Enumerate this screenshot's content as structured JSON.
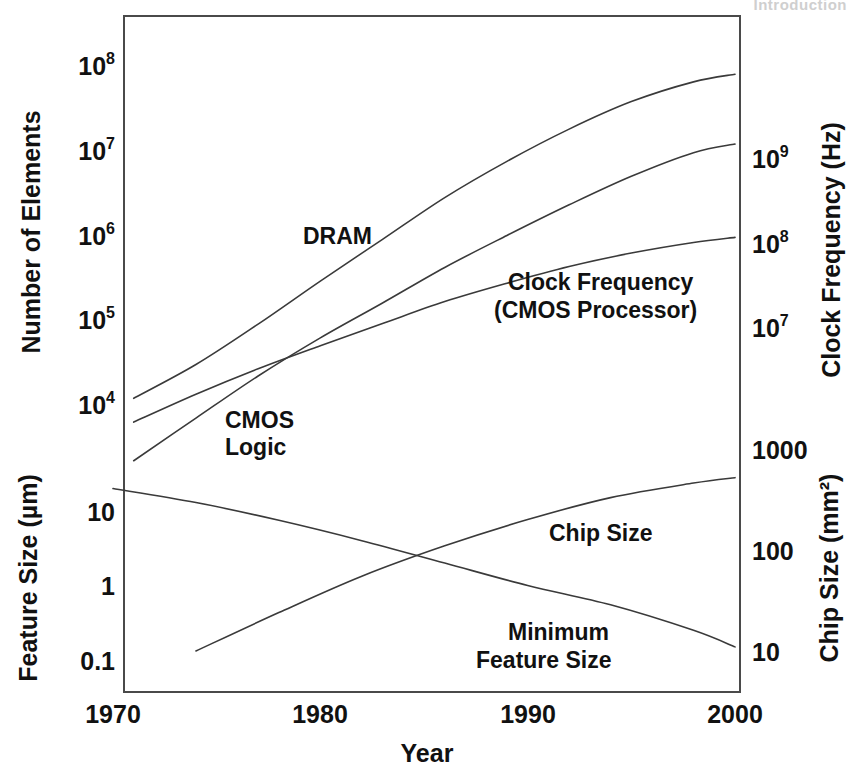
{
  "page": {
    "running_header": "Introduction"
  },
  "chart_data": {
    "type": "line",
    "title": "",
    "xlabel": "Year",
    "grid": false,
    "legend": "inline-labels",
    "xlim": [
      1968,
      2000
    ],
    "x_ticks": [
      1970,
      1980,
      1990,
      2000
    ],
    "x_tick_labels": [
      "1970",
      "1980",
      "1990",
      "2000"
    ],
    "axes": [
      {
        "id": "left-top",
        "label": "Number of Elements",
        "scale": "log",
        "ticks": [
          10000,
          100000,
          1000000,
          10000000,
          100000000
        ],
        "tick_labels": [
          "10⁴",
          "10⁵",
          "10⁶",
          "10⁷",
          "10⁸"
        ],
        "tick_bases": [
          "10",
          "10",
          "10",
          "10",
          "10"
        ],
        "tick_exponents": [
          "4",
          "5",
          "6",
          "7",
          "8"
        ]
      },
      {
        "id": "left-bottom",
        "label": "Feature Size (µm)",
        "scale": "log",
        "ticks": [
          0.1,
          1,
          10
        ],
        "tick_labels": [
          "0.1",
          "1",
          "10"
        ]
      },
      {
        "id": "right-top",
        "label": "Clock Frequency (Hz)",
        "scale": "log",
        "ticks": [
          10000000,
          100000000,
          1000000000
        ],
        "tick_labels": [
          "10⁷",
          "10⁸",
          "10⁹"
        ],
        "tick_bases": [
          "10",
          "10",
          "10"
        ],
        "tick_exponents": [
          "7",
          "8",
          "9"
        ]
      },
      {
        "id": "right-bottom",
        "label": "Chip Size (mm²)",
        "scale": "log",
        "ticks": [
          10,
          100,
          1000
        ],
        "tick_labels": [
          "10",
          "100",
          "1000"
        ]
      }
    ],
    "series": [
      {
        "name": "DRAM",
        "label": "DRAM",
        "axis": "left-top",
        "unit": "elements",
        "x": [
          1971,
          1974,
          1977,
          1980,
          1983,
          1986,
          1989,
          1992,
          1995,
          1998,
          2000
        ],
        "y": [
          12000,
          30000,
          90000,
          290000,
          900000,
          2800000,
          7500000,
          18000000,
          38000000,
          65000000,
          80000000
        ]
      },
      {
        "name": "CMOS Logic",
        "label": "CMOS\nLogic",
        "label_line1": "CMOS",
        "label_line2": "Logic",
        "axis": "left-top",
        "unit": "elements",
        "x": [
          1971,
          1974,
          1977,
          1980,
          1983,
          1986,
          1989,
          1992,
          1995,
          1998,
          2000
        ],
        "y": [
          2200,
          7000,
          22000,
          62000,
          160000,
          420000,
          1000000,
          2300000,
          5000000,
          9500000,
          12000000
        ]
      },
      {
        "name": "Clock Frequency (CMOS Processor)",
        "label_line1": "Clock Frequency",
        "label_line2": "(CMOS Processor)",
        "axis": "right-top",
        "unit": "Hz",
        "x": [
          1971,
          1974,
          1977,
          1980,
          1983,
          1986,
          1989,
          1992,
          1995,
          1998,
          2000
        ],
        "y": [
          750000,
          1600000,
          3200000,
          6000000,
          11000000,
          20000000,
          33000000,
          52000000,
          75000000,
          100000000,
          115000000
        ]
      },
      {
        "name": "Minimum Feature Size",
        "label_line1": "Minimum",
        "label_line2": "Feature Size",
        "axis": "left-bottom",
        "unit": "µm",
        "x": [
          1970,
          1974,
          1978,
          1982,
          1986,
          1990,
          1994,
          1998,
          2000
        ],
        "y": [
          20,
          13,
          7.5,
          4.0,
          2.0,
          1.0,
          0.55,
          0.25,
          0.15
        ]
      },
      {
        "name": "Chip Size",
        "label": "Chip Size",
        "axis": "right-bottom",
        "unit": "mm²",
        "x": [
          1974,
          1978,
          1982,
          1986,
          1990,
          1994,
          1998,
          2000
        ],
        "y": [
          10,
          24,
          55,
          110,
          200,
          330,
          460,
          520
        ]
      }
    ],
    "annotations": [
      {
        "text": "DRAM",
        "x": 1982,
        "series": "DRAM"
      },
      {
        "text": "CMOS Logic",
        "x": 1977,
        "series": "CMOS Logic"
      },
      {
        "text": "Clock Frequency (CMOS Processor)",
        "x": 1992,
        "series": "Clock Frequency (CMOS Processor)"
      },
      {
        "text": "Chip Size",
        "x": 1991,
        "series": "Chip Size"
      },
      {
        "text": "Minimum Feature Size",
        "x": 1992,
        "series": "Minimum Feature Size"
      }
    ]
  }
}
